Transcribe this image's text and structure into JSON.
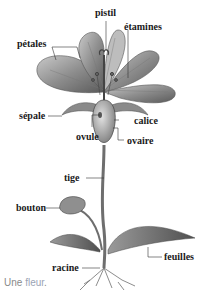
{
  "diagram": {
    "title": "Une fleur",
    "labels": {
      "pistil": "pistil",
      "etamines": "étamines",
      "petales": "pétales",
      "sepale": "sépale",
      "calice": "calice",
      "ovule": "ovule",
      "ovaire": "ovaire",
      "tige": "tige",
      "bouton": "bouton",
      "feuilles": "feuilles",
      "racine": "racine"
    },
    "caption": {
      "prefix": "Une ",
      "accent": "fleur",
      "suffix": "."
    }
  },
  "colors": {
    "label_text": "#1a1a1a",
    "leader_line": "#333333",
    "caption_text": "#8a8a8a",
    "caption_accent": "#9aa3b5",
    "illustration": "#6e6e6e"
  }
}
